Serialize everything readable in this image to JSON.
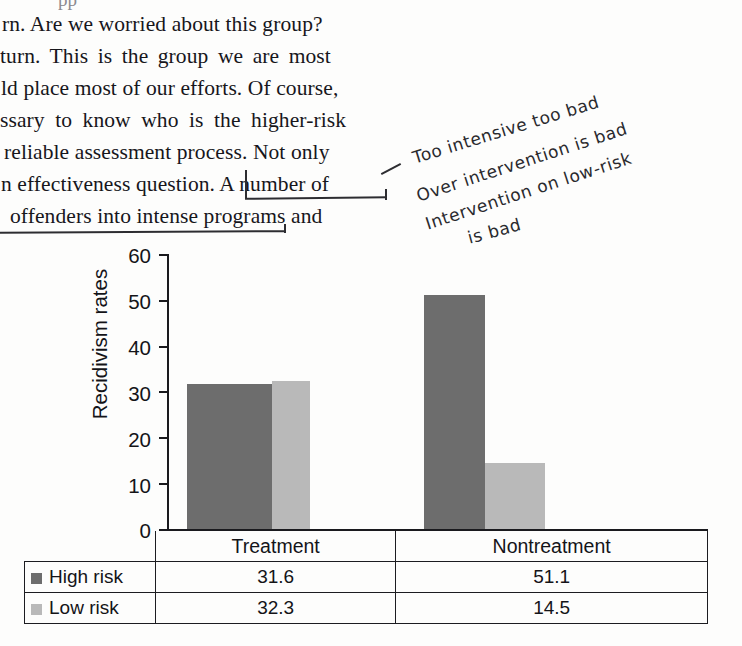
{
  "page": {
    "body_paragraph_lines": [
      "rn. Are we worried about this group?",
      "turn. This is the group we are most",
      "ld place most of our efforts. Of course,",
      "ssary to know who is the higher-risk",
      "reliable assessment process. Not only",
      "n effectiveness question. A number of",
      "offenders into intense programs and"
    ],
    "clipped_top_line": "pp"
  },
  "annotation": {
    "lines": [
      "Too intensive too bad",
      "Over intervention is bad",
      "Intervention on low-risk",
      "is bad"
    ],
    "ink_color": "#2d2d31"
  },
  "chart_data": {
    "type": "bar",
    "title": "",
    "xlabel": "",
    "ylabel": "Recidivism rates",
    "categories": [
      "Treatment",
      "Nontreatment"
    ],
    "series": [
      {
        "name": "High risk",
        "values": [
          31.6,
          51.1
        ],
        "color": "#6d6d6d"
      },
      {
        "name": "Low risk",
        "values": [
          32.3,
          14.5
        ],
        "color": "#b9b9b9"
      }
    ],
    "ylim": [
      0,
      60
    ],
    "yticks": [
      "0",
      "10",
      "20",
      "30",
      "40",
      "50",
      "60"
    ],
    "grid": false,
    "legend_position": "table-left-column",
    "data_table": {
      "column_headers": [
        "",
        "Treatment",
        "Nontreatment"
      ],
      "rows": [
        {
          "label": "High risk",
          "swatch": "#6d6d6d",
          "cells": [
            "31.6",
            "51.1"
          ]
        },
        {
          "label": "Low risk",
          "swatch": "#b9b9b9",
          "cells": [
            "32.3",
            "14.5"
          ]
        }
      ]
    }
  }
}
